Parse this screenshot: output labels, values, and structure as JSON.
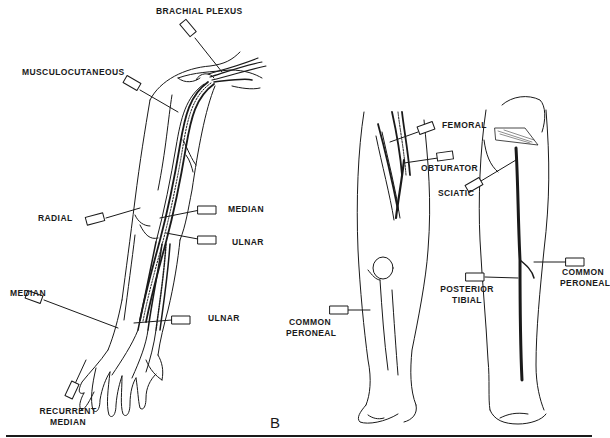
{
  "figure": {
    "panel_letter": "B",
    "arm": {
      "labels": [
        {
          "id": "brachial_plexus",
          "text": "BRACHIAL PLEXUS"
        },
        {
          "id": "musculocutaneous",
          "text": "MUSCULOCUTANEOUS"
        },
        {
          "id": "radial",
          "text": "RADIAL"
        },
        {
          "id": "median_elbow",
          "text": "MEDIAN"
        },
        {
          "id": "ulnar_elbow",
          "text": "ULNAR"
        },
        {
          "id": "median_wrist",
          "text": "MEDIAN"
        },
        {
          "id": "ulnar_wrist",
          "text": "ULNAR"
        },
        {
          "id": "recurrent_median_1",
          "text": "RECURRENT"
        },
        {
          "id": "recurrent_median_2",
          "text": "MEDIAN"
        }
      ]
    },
    "legs": {
      "labels": [
        {
          "id": "femoral",
          "text": "FEMORAL"
        },
        {
          "id": "obturator",
          "text": "OBTURATOR"
        },
        {
          "id": "sciatic",
          "text": "SCIATIC"
        },
        {
          "id": "common_peroneal_post_1",
          "text": "COMMON"
        },
        {
          "id": "common_peroneal_post_2",
          "text": "PERONEAL"
        },
        {
          "id": "posterior_tibial_1",
          "text": "POSTERIOR"
        },
        {
          "id": "posterior_tibial_2",
          "text": "TIBIAL"
        },
        {
          "id": "common_peroneal_ant_1",
          "text": "COMMON"
        },
        {
          "id": "common_peroneal_ant_2",
          "text": "PERONEAL"
        }
      ]
    },
    "colors": {
      "ink": "#1a1a1a",
      "background": "#ffffff"
    }
  }
}
